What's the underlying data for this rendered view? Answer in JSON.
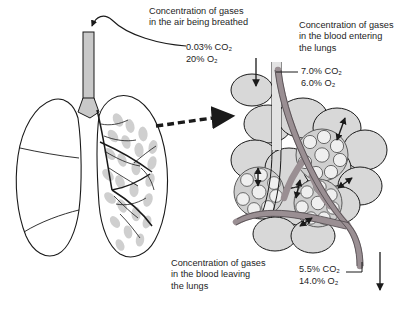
{
  "figure": {
    "labels": {
      "air": "Concentration of gases\nin the air being breathed",
      "blood_entering": "Concentration of gases\nin the blood entering\nthe lungs",
      "blood_leaving": "Concentration of gases\nin the blood leaving\nthe lungs"
    },
    "values": {
      "air": "0.03% CO₂\n20% O₂",
      "blood_entering": "7.0% CO₂\n6.0% O₂",
      "blood_leaving": "5.5% CO₂\n14.0% O₂"
    },
    "measurements": [
      {
        "site": "air being breathed",
        "co2": "0.03%",
        "o2": "20%"
      },
      {
        "site": "blood entering the lungs",
        "co2": "7.0%",
        "o2": "6.0%"
      },
      {
        "site": "blood leaving the lungs",
        "co2": "5.5%",
        "o2": "14.0%"
      }
    ],
    "colors": {
      "ink": "#1a1a1a",
      "lung_fill": "#ffffff",
      "alveoli_fill": "#d8d8d8",
      "alveoli_cluster": "#cfcfcf",
      "capillary": "#9a8f93",
      "bronchus": "#c9c9c9",
      "background": "#ffffff"
    }
  }
}
